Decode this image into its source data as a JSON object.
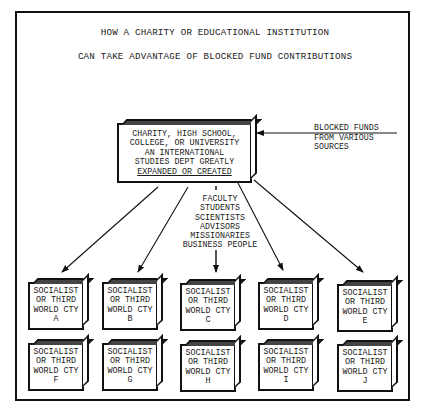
{
  "title": {
    "line1": "HOW A CHARITY OR EDUCATIONAL INSTITUTION",
    "line2": "CAN TAKE ADVANTAGE OF BLOCKED FUND CONTRIBUTIONS"
  },
  "central_node": {
    "lines": [
      "CHARITY, HIGH SCHOOL,",
      "COLLEGE, OR UNIVERSITY",
      "AN INTERNATIONAL",
      "STUDIES DEPT GREATLY",
      "EXPANDED OR CREATED"
    ]
  },
  "input_source": {
    "lines": [
      "BLOCKED FUNDS",
      "FROM VARIOUS",
      "SOURCES"
    ]
  },
  "participants": {
    "lines": [
      "FACULTY",
      "STUDENTS",
      "SCIENTISTS",
      "ADVISORS",
      "MISSIONARIES",
      "BUSINESS PEOPLE"
    ]
  },
  "destinations": [
    {
      "l1": "SOCIALIST",
      "l2": "OR THIRD",
      "l3": "WORLD CTY",
      "id": "A"
    },
    {
      "l1": "SOCIALIST",
      "l2": "OR THIRD",
      "l3": "WORLD CTY",
      "id": "B"
    },
    {
      "l1": "SOCIALIST",
      "l2": "OR THIRD",
      "l3": "WORLD CTY",
      "id": "C"
    },
    {
      "l1": "SOCIALIST",
      "l2": "OR THIRD",
      "l3": "WORLD CTY",
      "id": "D"
    },
    {
      "l1": "SOCIALIST",
      "l2": "OR THIRD",
      "l3": "WORLD CTY",
      "id": "E"
    },
    {
      "l1": "SOCIALIST",
      "l2": "OR THIRD",
      "l3": "WORLD CTY",
      "id": "F"
    },
    {
      "l1": "SOCIALIST",
      "l2": "OR THIRD",
      "l3": "WORLD CTY",
      "id": "G"
    },
    {
      "l1": "SOCIALIST",
      "l2": "OR THIRD",
      "l3": "WORLD CTY",
      "id": "H"
    },
    {
      "l1": "SOCIALIST",
      "l2": "OR THIRD",
      "l3": "WORLD CTY",
      "id": "I"
    },
    {
      "l1": "SOCIALIST",
      "l2": "OR THIRD",
      "l3": "WORLD CTY",
      "id": "J"
    }
  ],
  "colors": {
    "ink": "#111111",
    "paper": "#ffffff"
  }
}
